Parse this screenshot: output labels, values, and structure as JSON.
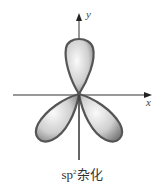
{
  "diagram": {
    "caption_base": "sp",
    "caption_sup": "2",
    "caption_suffix": "杂化",
    "axes": {
      "x_label": "x",
      "y_label": "y"
    },
    "lobes": [
      "top",
      "lower-left",
      "lower-right"
    ],
    "colors": {
      "lobe_outline": "#555555",
      "lobe_fill_light": "#f4f4f4",
      "lobe_fill_dark": "#8a8a8a",
      "axis": "#333333"
    }
  }
}
